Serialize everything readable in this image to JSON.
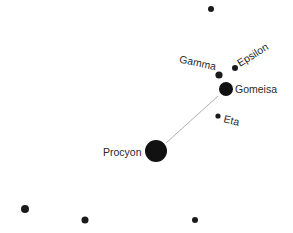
{
  "constellation": {
    "name": "Canis Minor",
    "line_color": "#9a9a9a",
    "star_color": "#1a1a1a",
    "label_color": "#2a2a2a",
    "background": "#ffffff"
  },
  "stars": [
    {
      "id": "top",
      "label": "",
      "x": 211,
      "y": 9,
      "r": 3
    },
    {
      "id": "gamma",
      "label": "Gamma",
      "x": 219,
      "y": 75,
      "r": 3.6
    },
    {
      "id": "epsilon",
      "label": "Epsilon",
      "x": 235,
      "y": 68,
      "r": 3
    },
    {
      "id": "gomeisa",
      "label": "Gomeisa",
      "x": 226,
      "y": 89,
      "r": 7
    },
    {
      "id": "eta",
      "label": "Eta",
      "x": 218,
      "y": 116,
      "r": 2.6
    },
    {
      "id": "procyon",
      "label": "Procyon",
      "x": 156,
      "y": 151,
      "r": 11
    },
    {
      "id": "bottom-left",
      "label": "",
      "x": 25,
      "y": 209,
      "r": 4
    },
    {
      "id": "bottom-mid",
      "label": "",
      "x": 85,
      "y": 220,
      "r": 3.5
    },
    {
      "id": "bottom-right",
      "label": "",
      "x": 195,
      "y": 220,
      "r": 3
    }
  ],
  "lines": [
    {
      "from": "procyon",
      "to": "gomeisa",
      "x1": 166,
      "y1": 143,
      "x2": 218,
      "y2": 96
    }
  ],
  "labels": {
    "gamma": "Gamma",
    "epsilon": "Epsilon",
    "gomeisa": "Gomeisa",
    "eta": "Eta",
    "procyon": "Procyon"
  }
}
